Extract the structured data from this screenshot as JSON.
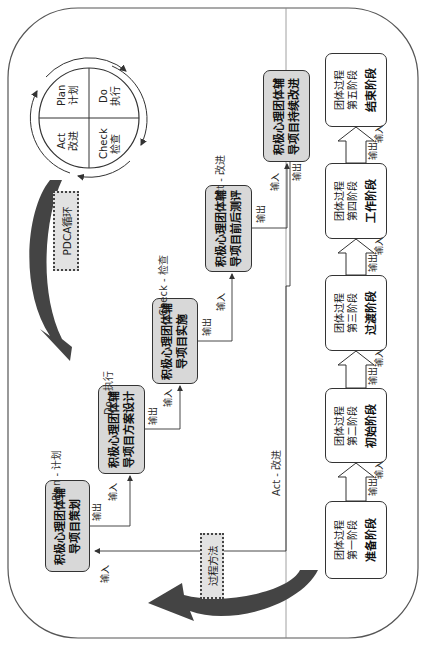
{
  "pdca_circle": {
    "plan": {
      "en": "Plan",
      "zh": "计划"
    },
    "do": {
      "en": "Do",
      "zh": "执行"
    },
    "check": {
      "en": "Check",
      "zh": "检查"
    },
    "act": {
      "en": "Act",
      "zh": "改进"
    }
  },
  "labels": {
    "pdca_cycle": "PDCA循环",
    "process_method": "过程方法",
    "plan_step": "Plan - 计划",
    "do_step": "Do - 执行",
    "check_step": "Check - 检查",
    "act_step": "Act - 改进",
    "act_return": "Act - 改进",
    "output": "输出",
    "input": "输入"
  },
  "pdca_boxes": [
    {
      "line1": "积极心理团体辅",
      "line2": "导项目策划"
    },
    {
      "line1": "积极心理团体辅",
      "line2": "导项目方案设计"
    },
    {
      "line1": "积极心理团体辅",
      "line2": "导项目实施"
    },
    {
      "line1": "积极心理团体辅",
      "line2": "导项目前后测评"
    },
    {
      "line1": "积极心理团体辅",
      "line2": "导项目持续改进"
    }
  ],
  "stages": [
    {
      "sub1": "团体过程",
      "sub2": "第一阶段",
      "name": "准备阶段"
    },
    {
      "sub1": "团体过程",
      "sub2": "第二阶段",
      "name": "初始阶段"
    },
    {
      "sub1": "团体过程",
      "sub2": "第三阶段",
      "name": "过渡阶段"
    },
    {
      "sub1": "团体过程",
      "sub2": "第四阶段",
      "name": "工作阶段"
    },
    {
      "sub1": "团体过程",
      "sub2": "第五阶段",
      "name": "结束阶段"
    }
  ],
  "colors": {
    "box_fill": "#d8d8d8",
    "border": "#333333",
    "arrow": "#444444"
  }
}
